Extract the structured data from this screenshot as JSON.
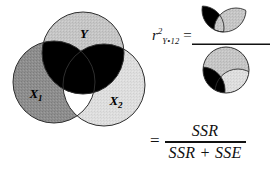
{
  "figure": {
    "venn": {
      "labels": {
        "y": "Y",
        "x1_base": "X",
        "x1_sub": "1",
        "x2_base": "X",
        "x2_sub": "2"
      },
      "regions": [
        {
          "name": "Y-only",
          "shade": "light-gray",
          "color": "#c6c6c6"
        },
        {
          "name": "X1-only",
          "shade": "medium-gray",
          "color": "#8e8e8e"
        },
        {
          "name": "X2-only",
          "shade": "very-light-gray",
          "color": "#dcdcdc"
        },
        {
          "name": "Y-overlap-with-X1-and-X2",
          "shade": "black",
          "color": "#000000"
        },
        {
          "name": "X1-X2-only-overlap",
          "shade": "white",
          "color": "#ffffff"
        }
      ]
    },
    "ratio_formula": {
      "lhs": {
        "symbol": "r",
        "superscript": "2",
        "subscript": "Y•12",
        "equals": "="
      },
      "numerator_caption": "black-and-gray-lens-pair",
      "denominator_caption": "full-Y-circle-with-black-region"
    },
    "ss_formula": {
      "equals": "=",
      "numerator": "SSR",
      "denominator": "SSR + SSE"
    }
  },
  "colors": {
    "black": "#000000",
    "outline": "#333333",
    "y_fill": "#c6c6c6",
    "x1_fill": "#8e8e8e",
    "x2_fill": "#dcdcdc",
    "white": "#ffffff",
    "background": "#ffffff"
  }
}
